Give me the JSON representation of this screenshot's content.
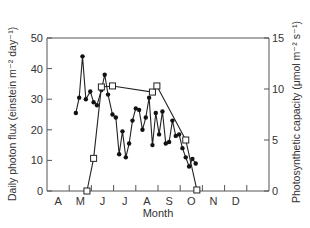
{
  "chart_data": {
    "type": "line",
    "title": "",
    "xlabel": "Month",
    "ylabel_left": "Daily photon flux (einstein m⁻² day⁻¹)",
    "ylabel_right": "Photosynthetic capacity (μmol m⁻² s⁻¹)",
    "x_tick_labels": [
      "A",
      "M",
      "J",
      "J",
      "A",
      "S",
      "O",
      "N",
      "D"
    ],
    "y_left_ticks": [
      0,
      10,
      20,
      30,
      40,
      50
    ],
    "y_right_ticks": [
      0,
      5,
      10,
      15
    ],
    "ylim_left": [
      0,
      50
    ],
    "ylim_right": [
      0,
      15
    ],
    "xlim_months": [
      0,
      10
    ],
    "grid": false,
    "legend": "none",
    "series": [
      {
        "name": "Daily photon flux",
        "axis": "left",
        "marker": "filled-circle",
        "x": [
          1.3,
          1.45,
          1.6,
          1.75,
          1.95,
          2.1,
          2.25,
          2.45,
          2.6,
          2.75,
          2.95,
          3.1,
          3.25,
          3.4,
          3.55,
          3.7,
          3.85,
          4.0,
          4.15,
          4.3,
          4.45,
          4.6,
          4.75,
          4.9,
          5.05,
          5.2,
          5.35,
          5.5,
          5.65,
          5.8,
          5.95,
          6.1,
          6.25,
          6.4,
          6.55,
          6.7
        ],
        "values": [
          25.5,
          30.5,
          44,
          30,
          32.5,
          29,
          28,
          33,
          38,
          31.5,
          25,
          24,
          12,
          19.5,
          11,
          15.5,
          23,
          27,
          26.5,
          20,
          24,
          30.5,
          15,
          25.5,
          18.5,
          26,
          15.5,
          16,
          23,
          18,
          18.5,
          14,
          11,
          8,
          10.5,
          9
        ]
      },
      {
        "name": "Photosynthetic capacity",
        "axis": "right",
        "marker": "open-square",
        "x": [
          1.8,
          2.1,
          2.45,
          2.95,
          4.75,
          4.95,
          6.25,
          6.75
        ],
        "values": [
          0,
          3.2,
          10.2,
          10.3,
          9.7,
          10.3,
          5,
          0.1
        ]
      }
    ]
  }
}
